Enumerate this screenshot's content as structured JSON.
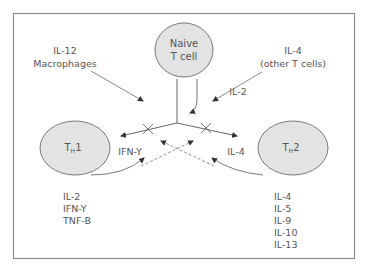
{
  "diagram": {
    "colors": {
      "border": "#8a8a8a",
      "cell_fill": "#e3e3e3",
      "cell_stroke": "#7a7a7a",
      "line": "#6a6a6a",
      "text": "#555555"
    },
    "nodes": {
      "naive": {
        "line1": "Naive",
        "line2": "T cell"
      },
      "th1": {
        "main": "T",
        "sub": "H",
        "suffix": "1"
      },
      "th2": {
        "main": "T",
        "sub": "H",
        "suffix": "2"
      }
    },
    "inputs": {
      "left": {
        "line1": "IL-12",
        "line2": "Macrophages"
      },
      "right": {
        "line1": "IL-4",
        "line2": "(other T cells)"
      },
      "il2": "IL-2"
    },
    "feedback": {
      "th1": "IFN-Y",
      "th2": "IL-4"
    },
    "outputs": {
      "th1": [
        "IL-2",
        "IFN-Y",
        "TNF-B"
      ],
      "th2": [
        "IL-4",
        "IL-5",
        "IL-9",
        "IL-10",
        "IL-13"
      ]
    }
  }
}
